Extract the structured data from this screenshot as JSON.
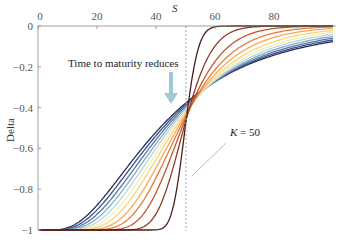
{
  "chart_data": {
    "type": "line",
    "title": "",
    "xlabel": "S",
    "ylabel": "Delta",
    "xlim": [
      0,
      100
    ],
    "ylim": [
      -1,
      0
    ],
    "x_ticks": [
      0,
      20,
      40,
      60,
      80
    ],
    "y_ticks": [
      0,
      -0.2,
      -0.4,
      -0.6,
      -0.8,
      -1
    ],
    "y_tick_labels": [
      "0",
      "-0.2",
      "-0.4",
      "-0.6",
      "-0.8",
      "-1"
    ],
    "x_tick_labels": [
      "0",
      "20",
      "40",
      "60",
      "80"
    ],
    "x_axis_position": "top",
    "grid": false,
    "strike": 50,
    "series_description": "Put option delta vs underlying price S for decreasing times to maturity (dark blue = longest, dark brown = shortest)",
    "series": [
      {
        "name": "T1 (longest)",
        "color": "#2b2d5e",
        "sigma_sqrt_t": 0.62
      },
      {
        "name": "T2",
        "color": "#3c4f86",
        "sigma_sqrt_t": 0.58
      },
      {
        "name": "T3",
        "color": "#5677a8",
        "sigma_sqrt_t": 0.54
      },
      {
        "name": "T4",
        "color": "#86acc9",
        "sigma_sqrt_t": 0.5
      },
      {
        "name": "T5",
        "color": "#b8d6e2",
        "sigma_sqrt_t": 0.46
      },
      {
        "name": "T6",
        "color": "#f3eeb0",
        "sigma_sqrt_t": 0.42
      },
      {
        "name": "T7",
        "color": "#f9d57a",
        "sigma_sqrt_t": 0.38
      },
      {
        "name": "T8",
        "color": "#f4aa5a",
        "sigma_sqrt_t": 0.33
      },
      {
        "name": "T9",
        "color": "#e57a3b",
        "sigma_sqrt_t": 0.28
      },
      {
        "name": "T10",
        "color": "#c4552b",
        "sigma_sqrt_t": 0.22
      },
      {
        "name": "T11",
        "color": "#8e3a24",
        "sigma_sqrt_t": 0.15
      },
      {
        "name": "T12 (shortest)",
        "color": "#4a1f18",
        "sigma_sqrt_t": 0.07
      }
    ],
    "annotations": [
      {
        "text": "Time to maturity reduces",
        "type": "arrow-label"
      },
      {
        "text": "K = 50",
        "type": "leader-label"
      }
    ]
  },
  "labels": {
    "x_axis_title": "S",
    "y_axis_title": "Delta",
    "maturity_note": "Time to maturity reduces",
    "strike_note_k": "K",
    "strike_note_rest": " = 50"
  },
  "colors": {
    "axis": "#888888",
    "strike_line": "#9aa7b8",
    "arrow": "#9ec9d6",
    "leader": "#aaaaaa"
  }
}
